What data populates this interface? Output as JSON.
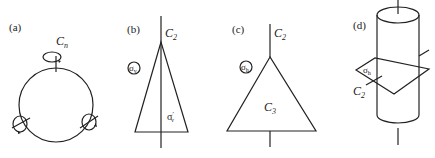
{
  "panels": [
    {
      "id": "a",
      "label": "(a)",
      "axis_label": "C",
      "axis_sub": "n"
    },
    {
      "id": "b",
      "label": "(b)",
      "axis_label": "C",
      "axis_sub": "2",
      "plane_label": "σ",
      "plane_sub": "v",
      "plane2_label": "σ",
      "plane2_sub": "v",
      "plane2_prime": "′"
    },
    {
      "id": "c",
      "label": "(c)",
      "axis_label": "C",
      "axis_sub": "2",
      "plane_label": "σ",
      "plane_sub": "h",
      "inner_label": "C",
      "inner_sub": "3"
    },
    {
      "id": "d",
      "label": "(d)",
      "plane_label": "σ",
      "plane_sub": "h",
      "axis_label": "C",
      "axis_sub": "2"
    }
  ]
}
